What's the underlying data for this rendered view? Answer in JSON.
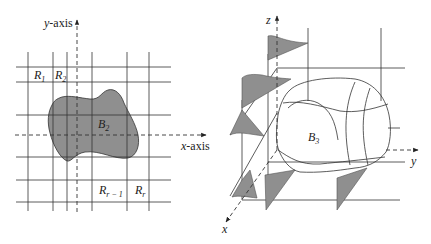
{
  "left_figure": {
    "y_axis_label": "y-axis",
    "x_axis_label": "x-axis",
    "region_labels": {
      "r1": {
        "main": "R",
        "sub": "1"
      },
      "r2": {
        "main": "R",
        "sub": "2"
      },
      "r_r_minus_1": {
        "main": "R",
        "sub": "r − 1"
      },
      "r_r": {
        "main": "R",
        "sub": "r"
      }
    },
    "body_label": {
      "main": "B",
      "sub": "2"
    }
  },
  "right_figure": {
    "z_axis_label": "z",
    "y_axis_label": "y",
    "x_axis_label": "x",
    "body_label": {
      "main": "B",
      "sub": "3"
    }
  },
  "colors": {
    "line": "#333333",
    "fill": "#8f8f8f",
    "background": "#ffffff"
  }
}
